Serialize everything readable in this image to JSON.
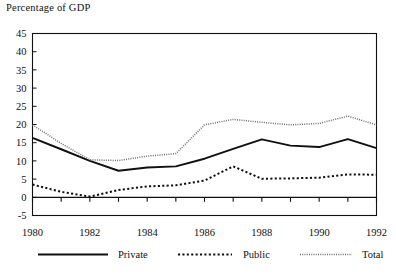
{
  "chart_data": {
    "type": "line",
    "title": "Percentage of GDP",
    "xlabel": "",
    "ylabel": "",
    "ylim": [
      -5,
      45
    ],
    "xlim": [
      1980,
      1992
    ],
    "grid": false,
    "legend_position": "bottom",
    "x": [
      1980,
      1981,
      1982,
      1983,
      1984,
      1985,
      1986,
      1987,
      1988,
      1989,
      1990,
      1991,
      1992
    ],
    "xtick_labels": [
      "1980",
      "1982",
      "1984",
      "1986",
      "1988",
      "1990",
      "1992"
    ],
    "xtick_values": [
      1980,
      1982,
      1984,
      1986,
      1988,
      1990,
      1992
    ],
    "ytick_labels": [
      "-5",
      "0",
      "5",
      "10",
      "15",
      "20",
      "25",
      "30",
      "35",
      "40",
      "45"
    ],
    "ytick_values": [
      -5,
      0,
      5,
      10,
      15,
      20,
      25,
      30,
      35,
      40,
      45
    ],
    "series": [
      {
        "name": "Private",
        "style": "solid",
        "color": "#101010",
        "values": [
          16.3,
          13.2,
          10.0,
          7.3,
          8.2,
          8.5,
          10.6,
          13.3,
          15.9,
          14.2,
          13.8,
          16.0,
          13.5
        ]
      },
      {
        "name": "Public",
        "style": "dotted",
        "color": "#101010",
        "values": [
          3.5,
          1.5,
          0.2,
          2.0,
          3.0,
          3.3,
          4.6,
          8.5,
          5.1,
          5.2,
          5.4,
          6.3,
          6.2
        ]
      },
      {
        "name": "Total",
        "style": "fine-dotted",
        "color": "#6f6f6f",
        "values": [
          19.9,
          14.8,
          10.3,
          10.1,
          11.3,
          12.0,
          19.9,
          21.4,
          20.6,
          19.9,
          20.3,
          22.3,
          19.9
        ]
      }
    ]
  },
  "legend": {
    "items": [
      {
        "label": "Private",
        "style": "solid"
      },
      {
        "label": "Public",
        "style": "dotted"
      },
      {
        "label": "Total",
        "style": "fine-dotted"
      }
    ]
  },
  "colors": {
    "axis": "#101010",
    "private": "#101010",
    "public": "#101010",
    "total": "#6f6f6f",
    "background": "#ffffff"
  }
}
